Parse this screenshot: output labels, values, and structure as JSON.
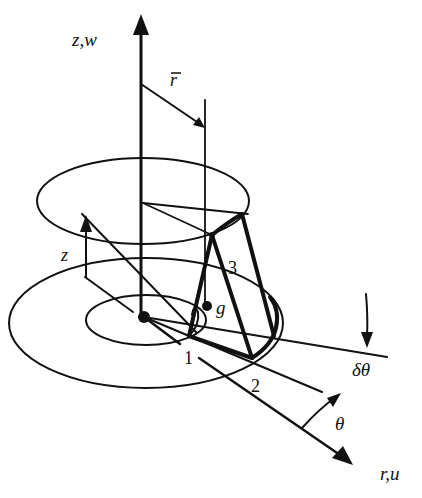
{
  "diagram": {
    "type": "3d-geometry-schematic",
    "colors": {
      "ink": "#111111",
      "background": "#ffffff"
    },
    "axes": {
      "vertical": {
        "label": "z,w"
      },
      "radial": {
        "label": "r,u"
      }
    },
    "labels": {
      "r_bar": "r",
      "z_height": "z",
      "point_1": "1",
      "point_2": "2",
      "point_3": "3",
      "centroid": "g",
      "delta_theta": "δθ",
      "theta": "θ"
    },
    "points": [
      {
        "id": "origin",
        "role": "center"
      },
      {
        "id": "1",
        "role": "element vertex"
      },
      {
        "id": "2",
        "role": "element vertex"
      },
      {
        "id": "3",
        "role": "element vertex"
      },
      {
        "id": "g",
        "role": "centroid"
      }
    ]
  }
}
